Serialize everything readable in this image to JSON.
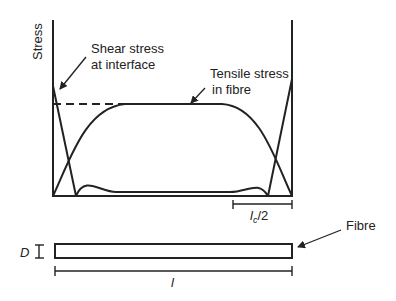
{
  "diagram": {
    "y_axis_label": "Stress",
    "annotations": {
      "shear": [
        "Shear stress",
        "at interface"
      ],
      "tensile": [
        "Tensile stress",
        "in fibre"
      ],
      "critical_length": "l",
      "critical_length_sub": "c",
      "critical_length_suffix": "/2",
      "diameter": "D",
      "length": "l",
      "fibre": "Fibre"
    },
    "colors": {
      "line": "#222222",
      "background": "#ffffff"
    }
  }
}
